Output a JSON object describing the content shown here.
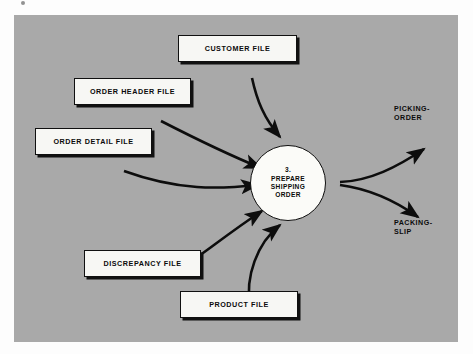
{
  "diagram": {
    "type": "data-flow-diagram",
    "background_color": "#a9a9a9",
    "page_background_color": "#fdfdfd",
    "line_color": "#101010",
    "box_fill_color": "#f7f7f4",
    "process": {
      "number": "3.",
      "line1": "PREPARE",
      "line2": "SHIPPING",
      "line3": "ORDER"
    },
    "data_stores": [
      {
        "id": "customer-file",
        "label": "CUSTOMER FILE"
      },
      {
        "id": "order-header-file",
        "label": "ORDER HEADER FILE"
      },
      {
        "id": "order-detail-file",
        "label": "ORDER DETAIL FILE"
      },
      {
        "id": "discrepancy-file",
        "label": "DISCREPANCY FILE"
      },
      {
        "id": "product-file",
        "label": "PRODUCT FILE"
      }
    ],
    "outputs": [
      {
        "id": "picking-order",
        "line1": "PICKING-",
        "line2": "ORDER"
      },
      {
        "id": "packing-slip",
        "line1": "PACKING-",
        "line2": "SLIP"
      }
    ]
  }
}
